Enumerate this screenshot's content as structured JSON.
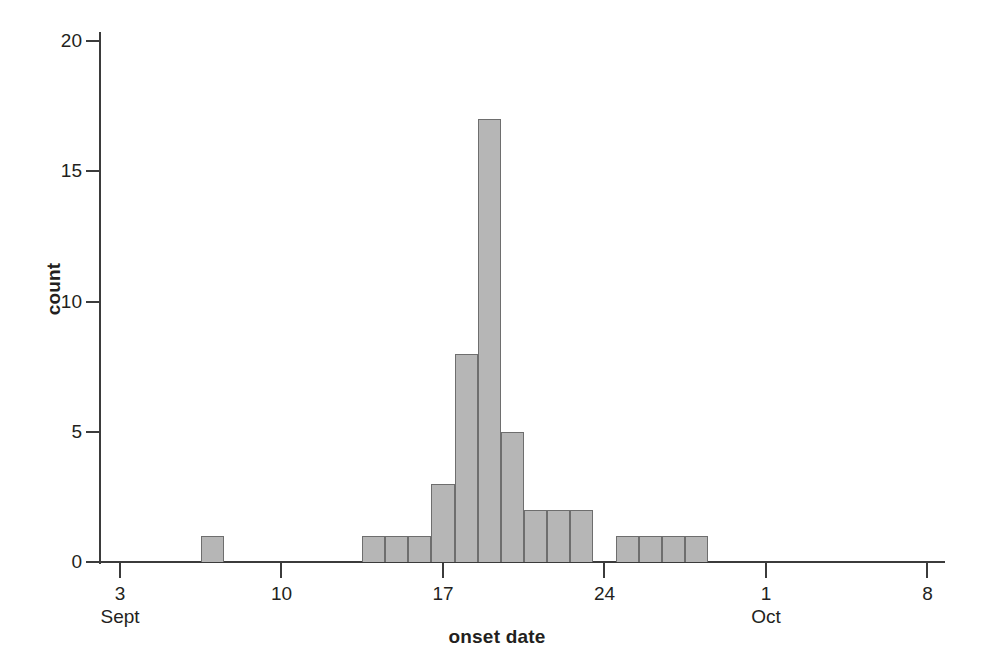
{
  "chart_data": {
    "type": "bar",
    "title": "",
    "subtitle": "",
    "xlabel": "onset date",
    "ylabel": "count",
    "grid": false,
    "legend": null,
    "legend_position": "none",
    "bar_color": "#b6b6b6",
    "bar_edge_color": "#6e6e6e",
    "axis_color": "#3b3b3b",
    "text_color": "#231f20",
    "bin_width_days": 1,
    "x_axis": {
      "type": "date",
      "range_start": "Sept 2",
      "range_end": "Oct 9",
      "ticks": [
        {
          "label": "3",
          "sublabel": "Sept",
          "value": 3
        },
        {
          "label": "10",
          "sublabel": "",
          "value": 10
        },
        {
          "label": "17",
          "sublabel": "",
          "value": 17
        },
        {
          "label": "24",
          "sublabel": "",
          "value": 24
        },
        {
          "label": "1",
          "sublabel": "Oct",
          "value": 31
        },
        {
          "label": "8",
          "sublabel": "",
          "value": 38
        }
      ]
    },
    "y_axis": {
      "ylim": [
        0,
        20
      ],
      "ticks": [
        {
          "label": "0",
          "value": 0
        },
        {
          "label": "5",
          "value": 5
        },
        {
          "label": "10",
          "value": 10
        },
        {
          "label": "15",
          "value": 15
        },
        {
          "label": "20",
          "value": 20
        }
      ]
    },
    "categories": [
      "Sept 7",
      "Sept 14",
      "Sept 15",
      "Sept 16",
      "Sept 17",
      "Sept 18",
      "Sept 19",
      "Sept 20",
      "Sept 21",
      "Sept 22",
      "Sept 23",
      "Sept 25",
      "Sept 26",
      "Sept 27",
      "Sept 28"
    ],
    "values": [
      1,
      1,
      1,
      1,
      3,
      8,
      17,
      5,
      2,
      2,
      2,
      1,
      1,
      1,
      1
    ],
    "bars": [
      {
        "category": "Sept 7",
        "day_index": 7,
        "value": 1
      },
      {
        "category": "Sept 14",
        "day_index": 14,
        "value": 1
      },
      {
        "category": "Sept 15",
        "day_index": 15,
        "value": 1
      },
      {
        "category": "Sept 16",
        "day_index": 16,
        "value": 1
      },
      {
        "category": "Sept 17",
        "day_index": 17,
        "value": 3
      },
      {
        "category": "Sept 18",
        "day_index": 18,
        "value": 8
      },
      {
        "category": "Sept 19",
        "day_index": 19,
        "value": 17
      },
      {
        "category": "Sept 20",
        "day_index": 20,
        "value": 5
      },
      {
        "category": "Sept 21",
        "day_index": 21,
        "value": 2
      },
      {
        "category": "Sept 22",
        "day_index": 22,
        "value": 2
      },
      {
        "category": "Sept 23",
        "day_index": 23,
        "value": 2
      },
      {
        "category": "Sept 25",
        "day_index": 25,
        "value": 1
      },
      {
        "category": "Sept 26",
        "day_index": 26,
        "value": 1
      },
      {
        "category": "Sept 27",
        "day_index": 27,
        "value": 1
      },
      {
        "category": "Sept 28",
        "day_index": 28,
        "value": 1
      }
    ],
    "total_count": 38
  }
}
